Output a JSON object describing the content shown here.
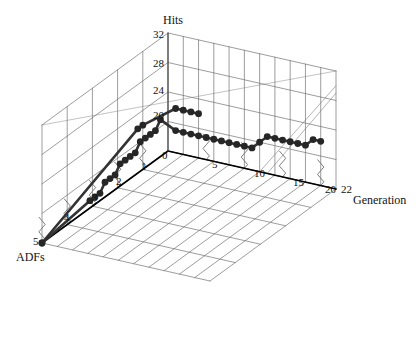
{
  "figure": {
    "kind": "3d-line-plot",
    "background_color": "#ffffff",
    "grid_color": "#6e6e6e",
    "axis_color": "#000000",
    "series_color": "#333333",
    "marker_color": "#262626"
  },
  "axes": {
    "vertical": {
      "title": "Hits",
      "ticks": [
        "32",
        "28",
        "24",
        "20"
      ],
      "tick_values": [
        32,
        28,
        24,
        20
      ],
      "range": [
        16,
        32
      ]
    },
    "depth": {
      "title": "ADFs",
      "ticks": [
        "0",
        "1",
        "2",
        "3",
        "4",
        "5"
      ],
      "tick_values": [
        0,
        1,
        2,
        3,
        4,
        5
      ],
      "range": [
        0,
        5
      ]
    },
    "horizontal": {
      "title": "Generation",
      "ticks": [
        "0",
        "5",
        "10",
        "15",
        "20",
        "22"
      ],
      "tick_values": [
        0,
        5,
        10,
        15,
        20,
        22
      ],
      "range": [
        0,
        22
      ]
    }
  },
  "chart_data": {
    "type": "line",
    "title": "",
    "xlabel": "Generation",
    "ylabel": "ADFs",
    "zlabel": "Hits",
    "grid": true,
    "legend": "none",
    "xlim": [
      0,
      22
    ],
    "ylim": [
      0,
      5
    ],
    "zlim": [
      16,
      32
    ],
    "series": [
      {
        "name": "hits-trace",
        "points": [
          {
            "generation": 0,
            "adfs": 5.0,
            "hits": 16
          },
          {
            "generation": 0,
            "adfs": 3.1,
            "hits": 17
          },
          {
            "generation": 0,
            "adfs": 2.9,
            "hits": 17
          },
          {
            "generation": 0,
            "adfs": 2.7,
            "hits": 17
          },
          {
            "generation": 0,
            "adfs": 2.5,
            "hits": 18
          },
          {
            "generation": 0,
            "adfs": 2.3,
            "hits": 18
          },
          {
            "generation": 0,
            "adfs": 2.1,
            "hits": 18
          },
          {
            "generation": 0,
            "adfs": 1.9,
            "hits": 19
          },
          {
            "generation": 0,
            "adfs": 1.7,
            "hits": 19
          },
          {
            "generation": 0,
            "adfs": 1.5,
            "hits": 19
          },
          {
            "generation": 0,
            "adfs": 1.3,
            "hits": 19
          },
          {
            "generation": 0,
            "adfs": 1.1,
            "hits": 20
          },
          {
            "generation": 0,
            "adfs": 0.9,
            "hits": 20
          },
          {
            "generation": 0,
            "adfs": 0.7,
            "hits": 20
          },
          {
            "generation": 0,
            "adfs": 0.5,
            "hits": 20
          },
          {
            "generation": 0,
            "adfs": 0.3,
            "hits": 21
          },
          {
            "generation": 1,
            "adfs": 0.0,
            "hits": 19
          },
          {
            "generation": 2,
            "adfs": 0.0,
            "hits": 19
          },
          {
            "generation": 3,
            "adfs": 0.0,
            "hits": 19
          },
          {
            "generation": 4,
            "adfs": 0.0,
            "hits": 19
          },
          {
            "generation": 5,
            "adfs": 0.0,
            "hits": 19
          },
          {
            "generation": 6,
            "adfs": 0.0,
            "hits": 19
          },
          {
            "generation": 7,
            "adfs": 0.0,
            "hits": 19
          },
          {
            "generation": 8,
            "adfs": 0.0,
            "hits": 19
          },
          {
            "generation": 9,
            "adfs": 0.0,
            "hits": 19
          },
          {
            "generation": 10,
            "adfs": 0.0,
            "hits": 19
          },
          {
            "generation": 11,
            "adfs": 0.0,
            "hits": 19
          },
          {
            "generation": 12,
            "adfs": 0.0,
            "hits": 20
          },
          {
            "generation": 13,
            "adfs": 0.0,
            "hits": 21
          },
          {
            "generation": 14,
            "adfs": 0.0,
            "hits": 21
          },
          {
            "generation": 15,
            "adfs": 0.0,
            "hits": 21
          },
          {
            "generation": 16,
            "adfs": 0.0,
            "hits": 21
          },
          {
            "generation": 17,
            "adfs": 0.0,
            "hits": 21
          },
          {
            "generation": 18,
            "adfs": 0.0,
            "hits": 21
          },
          {
            "generation": 19,
            "adfs": 0.0,
            "hits": 22
          },
          {
            "generation": 20,
            "adfs": 0.0,
            "hits": 22
          }
        ]
      },
      {
        "name": "upper-trace",
        "points": [
          {
            "generation": 0,
            "adfs": 5.0,
            "hits": 16
          },
          {
            "generation": 0,
            "adfs": 1.2,
            "hits": 22
          },
          {
            "generation": 0,
            "adfs": 1.0,
            "hits": 22
          },
          {
            "generation": 1,
            "adfs": 0.0,
            "hits": 22
          },
          {
            "generation": 2,
            "adfs": 0.0,
            "hits": 22
          },
          {
            "generation": 3,
            "adfs": 0.0,
            "hits": 22
          },
          {
            "generation": 4,
            "adfs": 0.0,
            "hits": 22
          }
        ]
      }
    ]
  }
}
